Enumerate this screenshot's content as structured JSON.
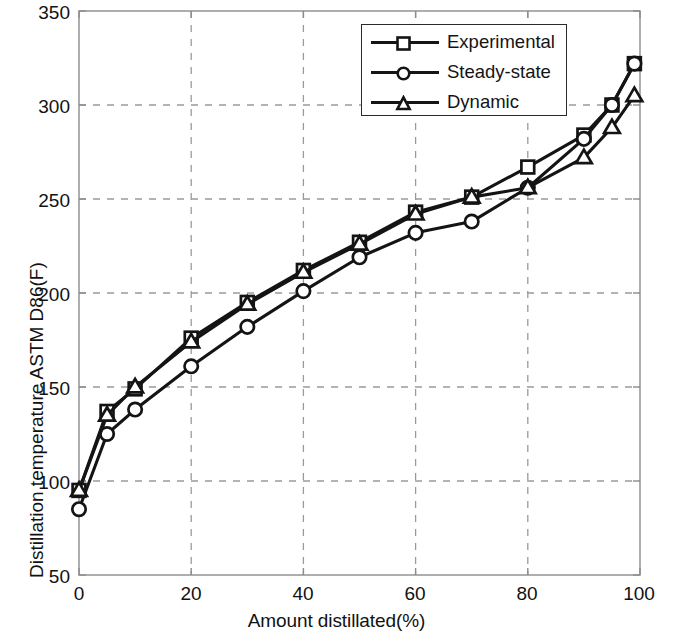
{
  "chart_data": {
    "type": "line",
    "title": "",
    "xlabel": "Amount distillated(%)",
    "ylabel": "Distillation temperature ASTM D86(F)",
    "xlim": [
      0,
      100
    ],
    "ylim": [
      50,
      350
    ],
    "xticks": [
      0,
      20,
      40,
      60,
      80,
      100
    ],
    "yticks": [
      50,
      100,
      150,
      200,
      250,
      300,
      350
    ],
    "grid": true,
    "grid_style": "dashed",
    "legend_position": "top-right",
    "x": [
      0,
      5,
      10,
      20,
      30,
      40,
      50,
      60,
      70,
      80,
      90,
      95,
      99
    ],
    "series": [
      {
        "name": "Experimental",
        "marker": "square",
        "color": "#141414",
        "values": [
          95,
          137,
          149,
          176,
          195,
          212,
          227,
          243,
          251,
          267,
          284,
          300,
          322
        ]
      },
      {
        "name": "Steady-state",
        "marker": "circle",
        "color": "#141414",
        "values": [
          85,
          125,
          138,
          161,
          182,
          201,
          219,
          232,
          238,
          256,
          282,
          300,
          322
        ]
      },
      {
        "name": "Dynamic",
        "marker": "triangle",
        "color": "#141414",
        "values": [
          95,
          135,
          150,
          174,
          194,
          211,
          226,
          242,
          251,
          256,
          272,
          288,
          305
        ]
      }
    ]
  },
  "axes": {
    "xtick_labels": [
      "0",
      "20",
      "40",
      "60",
      "80",
      "100"
    ],
    "ytick_labels": [
      "50",
      "100",
      "150",
      "200",
      "250",
      "300",
      "350"
    ],
    "xlabel": "Amount distillated(%)",
    "ylabel": "Distillation temperature ASTM D86(F)"
  },
  "legend": {
    "entries": [
      {
        "label": "Experimental",
        "marker": "square-marker-icon"
      },
      {
        "label": "Steady-state",
        "marker": "circle-marker-icon"
      },
      {
        "label": "Dynamic",
        "marker": "triangle-marker-icon"
      }
    ]
  },
  "style": {
    "axis_color": "#8c8c8c",
    "grid_color": "#9a9a9a",
    "line_color": "#141414",
    "background": "#ffffff"
  }
}
